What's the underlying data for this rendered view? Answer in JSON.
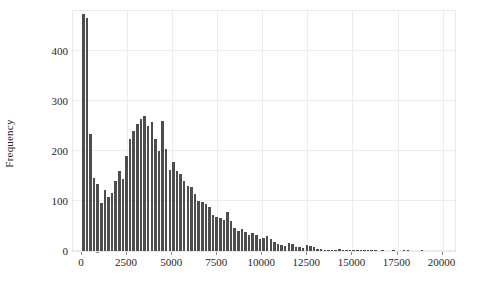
{
  "chart_data": {
    "type": "bar",
    "title": "",
    "subtitle": "",
    "xlabel": "",
    "ylabel": "Frequency",
    "xlim": [
      -500,
      20800
    ],
    "ylim": [
      0,
      485
    ],
    "grid": true,
    "legend": null,
    "bin_width": 200,
    "bar_color": "#4d4d4d",
    "xticks": [
      0,
      2500,
      5000,
      7500,
      10000,
      12500,
      15000,
      17500,
      20000
    ],
    "xtick_labels": [
      "0",
      "2500",
      "5000",
      "7500",
      "10000",
      "12500",
      "15000",
      "17500",
      "20000"
    ],
    "yticks": [
      0,
      100,
      200,
      300,
      400
    ],
    "ytick_labels": [
      "0",
      "100",
      "200",
      "300",
      "400"
    ],
    "bin_centers": [
      100,
      300,
      500,
      700,
      900,
      1100,
      1300,
      1500,
      1700,
      1900,
      2100,
      2300,
      2500,
      2700,
      2900,
      3100,
      3300,
      3500,
      3700,
      3900,
      4100,
      4300,
      4500,
      4700,
      4900,
      5100,
      5300,
      5500,
      5700,
      5900,
      6100,
      6300,
      6500,
      6700,
      6900,
      7100,
      7300,
      7500,
      7700,
      7900,
      8100,
      8300,
      8500,
      8700,
      8900,
      9100,
      9300,
      9500,
      9700,
      9900,
      10100,
      10300,
      10500,
      10700,
      10900,
      11100,
      11300,
      11500,
      11700,
      11900,
      12100,
      12300,
      12500,
      12700,
      12900,
      13100,
      13300,
      13500,
      13700,
      13900,
      14100,
      14300,
      14500,
      14700,
      14900,
      15100,
      15300,
      15500,
      15700,
      15900,
      16100,
      16300,
      16500,
      16700,
      16900,
      17100,
      17300,
      17500,
      17700,
      17900,
      18100,
      18300,
      18500,
      18700,
      18900,
      19100,
      19300,
      19500,
      19700,
      19900
    ],
    "values": [
      475,
      466,
      234,
      147,
      134,
      96,
      122,
      108,
      117,
      140,
      160,
      144,
      190,
      225,
      240,
      255,
      265,
      270,
      250,
      258,
      225,
      200,
      260,
      205,
      162,
      178,
      160,
      155,
      140,
      130,
      128,
      115,
      100,
      98,
      95,
      88,
      72,
      68,
      67,
      63,
      78,
      60,
      47,
      40,
      45,
      38,
      32,
      37,
      33,
      24,
      26,
      30,
      24,
      18,
      14,
      13,
      10,
      16,
      15,
      9,
      8,
      7,
      12,
      10,
      9,
      5,
      4,
      3,
      3,
      2,
      2,
      4,
      3,
      2,
      1,
      2,
      1,
      1,
      1,
      2,
      1,
      1,
      0,
      1,
      0,
      0,
      1,
      0,
      0,
      1,
      1,
      0,
      0,
      0,
      1,
      0,
      0,
      0,
      0,
      0
    ]
  },
  "axes": {
    "ylabel_text": "Frequency",
    "xlabel_text": ""
  }
}
